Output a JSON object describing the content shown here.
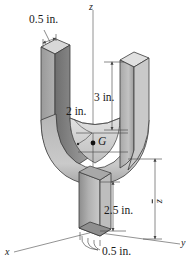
{
  "figure": {
    "watermark_text": "",
    "colors": {
      "outline": "#2b2b2b",
      "face_light": "#d9d9d9",
      "face_mid": "#b3b3b3",
      "face_dark": "#8f8f8f",
      "face_darker": "#6f6f6f",
      "axis": "#6b6b6b",
      "dimension": "#555555",
      "label": "#1a1a1a"
    },
    "axes": [
      {
        "name": "x",
        "label": "x",
        "position": "bottom-left"
      },
      {
        "name": "y",
        "label": "y",
        "position": "bottom-right"
      },
      {
        "name": "z",
        "label": "z",
        "position": "top-center"
      }
    ],
    "dimensions": [
      {
        "id": "arm-thickness",
        "label": "0.5 in.",
        "value": 0.5,
        "unit": "in.",
        "location": "top-left"
      },
      {
        "id": "arm-height",
        "label": "3 in.",
        "value": 3,
        "unit": "in.",
        "location": "upper-right"
      },
      {
        "id": "bend-radius",
        "label": "2 in.",
        "value": 2,
        "unit": "in.",
        "location": "mid-left"
      },
      {
        "id": "stem-height",
        "label": "2.5 in.",
        "value": 2.5,
        "unit": "in.",
        "location": "lower-right"
      },
      {
        "id": "base-width",
        "label": "0.5 in.",
        "value": 0.5,
        "unit": "in.",
        "location": "bottom"
      },
      {
        "id": "centroid-height",
        "label": "z",
        "value": null,
        "unit": "",
        "location": "far-right"
      }
    ],
    "points": [
      {
        "id": "centroid",
        "label": "G",
        "description": "centroid of the bracket"
      }
    ]
  }
}
